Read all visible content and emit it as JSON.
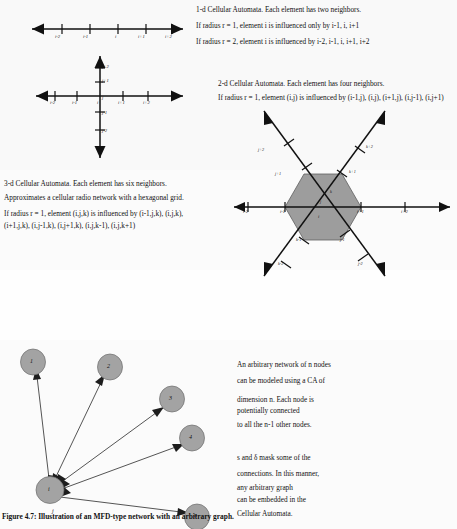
{
  "figure": {
    "caption": "Figure 4.7: Illustration of an MFD-type network with an arbitrary graph."
  },
  "section_1d": {
    "lines": [
      "1-d Cellular Automata. Each element has two neighbors.",
      "If radius r = 1, element i is influenced only by i-1, i, i+1",
      "If radius r = 2, element i is influenced by i-2, i-1, i, i+1, i+2"
    ],
    "axis_labels": [
      "i-2",
      "i-1",
      "i",
      "i+1",
      "i+2"
    ]
  },
  "section_2d": {
    "lines": [
      "2-d Cellular Automata. Each element has four neighbors.",
      "If radius r = 1, element (i,j) is influenced by (i-1,j), (i,j), (i+1,j), (i,j-1), (i,j+1)"
    ],
    "x_labels": [
      "i-2",
      "i-1",
      "i",
      "i+1",
      "i+2"
    ],
    "y_labels": [
      "j+2",
      "j+1",
      "j",
      "j-1",
      "j-2"
    ]
  },
  "section_3d": {
    "lines": [
      "3-d Cellular Automata. Each element has six neighbors.",
      "Approximates a cellular radio network with a hexagonal grid.",
      "If radius r = 1, element (i,j,k) is influenced by (i-1,j,k), (i,j,k),",
      "(i+1,j,k), (i,j-1,k), (i,j+1,k), (i,j,k-1), (i,j,k+1)"
    ],
    "x_labels": [
      "i-2",
      "i-1",
      "i",
      "i+1",
      "i+2"
    ],
    "j_labels": [
      "j+2",
      "j+1",
      "j",
      "j-1",
      "j-2"
    ],
    "k_labels": [
      "k+2",
      "k+1",
      "k",
      "k-1",
      "k-2"
    ]
  },
  "graph": {
    "center_node": "i",
    "center_edge_label": "j",
    "nodes": [
      "1",
      "2",
      "3",
      "4",
      "n"
    ],
    "text_block_1": [
      "An arbitrary network of  n  nodes",
      "can be modeled using a CA of",
      "dimension n. Each node is",
      "potentially connected",
      "to all the n-1 other nodes."
    ],
    "text_block_2": [
      "s  and δ   mask some of the",
      "connections. In this manner,",
      "any arbitrary graph",
      "can be embedded in the",
      "Cellular Automata."
    ]
  },
  "colors": {
    "hex_fill": "#9d9d9d",
    "node_fill": "#a3a3a3",
    "ink": "#111111"
  }
}
